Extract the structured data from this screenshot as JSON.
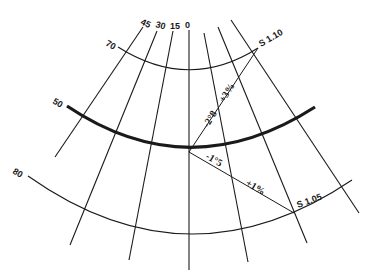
{
  "diagram": {
    "meridian_labels": [
      "45",
      "30",
      "15",
      "0"
    ],
    "parallel_labels": {
      "top": "70",
      "middle": "50",
      "bottom": "80"
    },
    "annotations": {
      "scale_upper": "S 1.10",
      "scale_lower": "S 1.05",
      "angle_upper": "-2°8",
      "percent_upper": "+3%",
      "angle_lower": "-1°5",
      "percent_lower": "+1%"
    },
    "colors": {
      "line": "#1a1a1a",
      "background": "#ffffff"
    }
  }
}
